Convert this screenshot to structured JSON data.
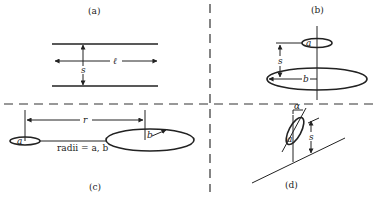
{
  "figure": {
    "panels": {
      "a": {
        "label": "(a)",
        "description": "two parallel lines of length l separated by s",
        "symbols": {
          "length": "ℓ",
          "separation": "s"
        }
      },
      "b": {
        "label": "(b)",
        "description": "two coaxial rings of radii a and b separated by s",
        "symbols": {
          "small_radius": "a",
          "large_radius": "b",
          "separation": "s"
        }
      },
      "c": {
        "label": "(c)",
        "description": "two coplanar rings separated by center distance r",
        "symbols": {
          "distance": "r",
          "small_radius": "a",
          "large_radius": "b"
        },
        "caption": "radii = a, b"
      },
      "d": {
        "label": "(d)",
        "description": "tilted ring of radius a at angle alpha above a plane at height s",
        "symbols": {
          "angle": "α",
          "radius": "a",
          "height": "s"
        }
      }
    },
    "colors": {
      "ink": "#222222",
      "background": "#ffffff"
    }
  }
}
